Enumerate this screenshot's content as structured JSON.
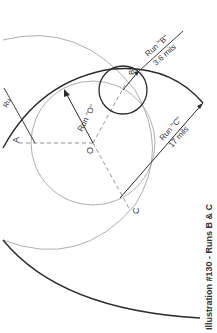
{
  "diagram": {
    "caption": "Illustration #130 - Runs B & C",
    "points": {
      "O": "O",
      "A": "A",
      "B": "B",
      "C": "C"
    },
    "runs": {
      "o_label": "Run \"O\"",
      "b_label": "Run \"B\"",
      "b_value": "3.6 mils",
      "c_label": "Run \"C\"",
      "c_value": "17 mils",
      "a_partial": "Ru"
    },
    "colors": {
      "dark_line": "#2b2b2b",
      "light_line": "#9a9a9a",
      "text": "#333333"
    }
  }
}
